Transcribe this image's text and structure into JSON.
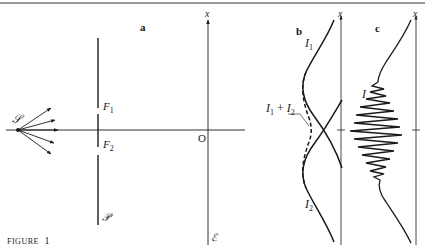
{
  "figure": {
    "caption_word": "FIGURE",
    "caption_number": "1"
  },
  "panel_a": {
    "label": "a",
    "source_label": "𝒮",
    "slit1_label": "F",
    "slit1_sub": "1",
    "slit2_label": "F",
    "slit2_sub": "2",
    "barrier_label": "𝒫",
    "origin_label": "O",
    "axis_label": "x",
    "screen_label": "ℰ"
  },
  "panel_b": {
    "label": "b",
    "axis_label": "x",
    "curve1_label": "I",
    "curve1_sub": "1",
    "curve2_label": "I",
    "curve2_sub": "2",
    "sum_label_a": "I",
    "sum_sub_a": "1",
    "sum_plus": "+",
    "sum_label_b": "I",
    "sum_sub_b": "2"
  },
  "panel_c": {
    "label": "c",
    "axis_label": "x",
    "curve_label": "I"
  },
  "colors": {
    "ink": "#1a1a1a",
    "background": "#ffffff"
  }
}
